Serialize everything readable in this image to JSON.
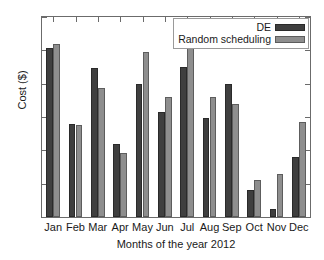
{
  "chart_data": {
    "type": "bar",
    "title": "",
    "subtitle": "",
    "xlabel": "Months of the year 2012",
    "ylabel": "Cost ($)",
    "categories": [
      "Jan",
      "Feb",
      "Mar",
      "Apr",
      "May",
      "Jun",
      "Jul",
      "Aug",
      "Sep",
      "Oct",
      "Nov",
      "Dec"
    ],
    "series": [
      {
        "name": "DE",
        "color": "#3f3f3f",
        "values": [
          140.3,
          128.9,
          137.4,
          125.9,
          135.0,
          130.8,
          137.5,
          129.9,
          135.0,
          119.0,
          116.2,
          124.0
        ]
      },
      {
        "name": "Random scheduling",
        "color": "#8e8e8e",
        "values": [
          141.0,
          128.8,
          134.3,
          124.6,
          139.8,
          133.0,
          143.1,
          133.0,
          132.0,
          120.5,
          121.4,
          129.2
        ]
      }
    ],
    "ylim": [
      115,
      145
    ],
    "yticks": [
      115,
      120,
      125,
      130,
      135,
      140,
      145
    ],
    "ytick_labels": [
      "115",
      "120",
      "125",
      "130",
      "135",
      "140",
      "145"
    ],
    "grid": false,
    "legend_position": "top-right",
    "legend_entries": [
      "DE",
      "Random scheduling"
    ],
    "annotations": []
  }
}
